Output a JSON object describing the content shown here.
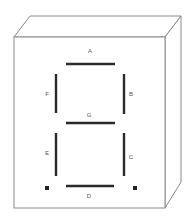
{
  "diagram": {
    "segments": [
      {
        "id": "A",
        "label": "A",
        "orientation": "horizontal",
        "position": "top"
      },
      {
        "id": "B",
        "label": "B",
        "orientation": "vertical",
        "position": "upper-right"
      },
      {
        "id": "C",
        "label": "C",
        "orientation": "vertical",
        "position": "lower-right"
      },
      {
        "id": "D",
        "label": "D",
        "orientation": "horizontal",
        "position": "bottom"
      },
      {
        "id": "E",
        "label": "E",
        "orientation": "vertical",
        "position": "lower-left"
      },
      {
        "id": "F",
        "label": "F",
        "orientation": "vertical",
        "position": "upper-left"
      },
      {
        "id": "G",
        "label": "G",
        "orientation": "horizontal",
        "position": "middle"
      }
    ],
    "decimal_points": [
      {
        "position": "bottom-left"
      },
      {
        "position": "bottom-right"
      }
    ],
    "colors": {
      "segment": "#2a2a2a",
      "outline": "#8a8a8a",
      "label": "#555555",
      "background": "#ffffff"
    }
  }
}
